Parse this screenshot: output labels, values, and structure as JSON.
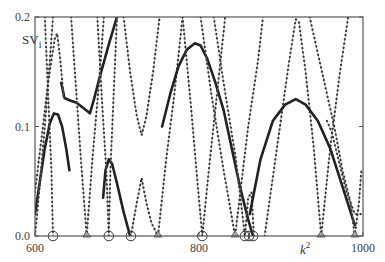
{
  "chart_data": {
    "type": "line",
    "title": "",
    "xlabel": "k^2",
    "ylabel": "SV_i",
    "xlim": [
      600,
      1000
    ],
    "ylim": [
      0.0,
      0.2
    ],
    "xticks": [
      600,
      800,
      1000
    ],
    "xtick_labels": [
      "600",
      "800",
      "1000"
    ],
    "yticks": [
      0.0,
      0.1,
      0.2
    ],
    "ytick_labels": [
      "0.0",
      "0.1",
      "0.2"
    ],
    "grid": false,
    "legend": null,
    "series": [
      {
        "name": "thick-left-hump",
        "style": "solid",
        "points": [
          [
            600,
            0.02
          ],
          [
            606,
            0.05
          ],
          [
            612,
            0.08
          ],
          [
            618,
            0.103
          ],
          [
            623,
            0.112
          ],
          [
            628,
            0.111
          ],
          [
            633,
            0.1
          ],
          [
            638,
            0.08
          ],
          [
            642,
            0.06
          ]
        ]
      },
      {
        "name": "thick-plateau",
        "style": "solid",
        "points": [
          [
            632,
            0.14
          ],
          [
            636,
            0.126
          ],
          [
            642,
            0.124
          ],
          [
            650,
            0.122
          ],
          [
            657,
            0.118
          ],
          [
            664,
            0.114
          ],
          [
            667,
            0.112
          ],
          [
            672,
            0.125
          ],
          [
            680,
            0.148
          ],
          [
            690,
            0.175
          ],
          [
            700,
            0.2
          ]
        ]
      },
      {
        "name": "left-rise-peak",
        "style": "dotted",
        "points": [
          [
            600,
            0.04
          ],
          [
            608,
            0.09
          ],
          [
            616,
            0.14
          ],
          [
            624,
            0.18
          ],
          [
            627,
            0.185
          ],
          [
            631,
            0.16
          ],
          [
            635,
            0.126
          ]
        ]
      },
      {
        "name": "left-steep-1",
        "style": "dotted",
        "points": [
          [
            612,
            0.2
          ],
          [
            616,
            0.13
          ],
          [
            620,
            0.06
          ],
          [
            622,
            0.0
          ]
        ]
      },
      {
        "name": "left-steep-2",
        "style": "dotted",
        "points": [
          [
            600,
            0.0
          ],
          [
            605,
            0.04
          ],
          [
            612,
            0.1
          ],
          [
            618,
            0.16
          ],
          [
            622,
            0.2
          ]
        ]
      },
      {
        "name": "v-663",
        "style": "dotted",
        "points": [
          [
            644,
            0.2
          ],
          [
            650,
            0.135
          ],
          [
            656,
            0.07
          ],
          [
            663,
            0.0
          ],
          [
            670,
            0.07
          ],
          [
            678,
            0.14
          ],
          [
            684,
            0.2
          ]
        ]
      },
      {
        "name": "thick-small-hump",
        "style": "solid",
        "points": [
          [
            683,
            0.035
          ],
          [
            686,
            0.06
          ],
          [
            690,
            0.07
          ],
          [
            694,
            0.066
          ],
          [
            700,
            0.048
          ],
          [
            708,
            0.022
          ],
          [
            716,
            0.0
          ]
        ]
      },
      {
        "name": "steep-690",
        "style": "dotted",
        "points": [
          [
            676,
            0.2
          ],
          [
            682,
            0.12
          ],
          [
            687,
            0.06
          ],
          [
            690,
            0.0
          ],
          [
            692,
            0.06
          ],
          [
            696,
            0.13
          ],
          [
            700,
            0.2
          ]
        ]
      },
      {
        "name": "v-730",
        "style": "dotted",
        "points": [
          [
            708,
            0.2
          ],
          [
            716,
            0.15
          ],
          [
            724,
            0.11
          ],
          [
            730,
            0.092
          ],
          [
            736,
            0.11
          ],
          [
            744,
            0.15
          ],
          [
            752,
            0.2
          ]
        ]
      },
      {
        "name": "hump-734",
        "style": "dotted",
        "points": [
          [
            717,
            0.0
          ],
          [
            724,
            0.03
          ],
          [
            730,
            0.053
          ],
          [
            736,
            0.03
          ],
          [
            742,
            0.012
          ],
          [
            750,
            0.0
          ],
          [
            760,
            0.07
          ],
          [
            770,
            0.13
          ],
          [
            780,
            0.2
          ]
        ]
      },
      {
        "name": "thick-big-dome",
        "style": "solid",
        "points": [
          [
            755,
            0.1
          ],
          [
            765,
            0.13
          ],
          [
            775,
            0.155
          ],
          [
            785,
            0.17
          ],
          [
            795,
            0.176
          ],
          [
            802,
            0.174
          ],
          [
            810,
            0.162
          ],
          [
            820,
            0.14
          ],
          [
            830,
            0.115
          ],
          [
            840,
            0.08
          ],
          [
            850,
            0.045
          ],
          [
            860,
            0.015
          ],
          [
            866,
            0.0
          ]
        ]
      },
      {
        "name": "steep-804",
        "style": "dotted",
        "points": [
          [
            780,
            0.2
          ],
          [
            790,
            0.12
          ],
          [
            798,
            0.05
          ],
          [
            804,
            0.0
          ],
          [
            812,
            0.06
          ],
          [
            822,
            0.13
          ],
          [
            832,
            0.2
          ]
        ]
      },
      {
        "name": "v-844",
        "style": "dotted",
        "points": [
          [
            802,
            0.2
          ],
          [
            815,
            0.13
          ],
          [
            830,
            0.06
          ],
          [
            844,
            0.0
          ],
          [
            852,
            0.05
          ],
          [
            860,
            0.1
          ],
          [
            872,
            0.16
          ],
          [
            878,
            0.2
          ]
        ]
      },
      {
        "name": "cluster-860",
        "style": "dotted",
        "points": [
          [
            818,
            0.2
          ],
          [
            830,
            0.14
          ],
          [
            845,
            0.07
          ],
          [
            856,
            0.0
          ],
          [
            860,
            0.035
          ],
          [
            864,
            0.04
          ],
          [
            867,
            0.0
          ]
        ]
      },
      {
        "name": "peak-920",
        "style": "dotted",
        "points": [
          [
            880,
            0.0
          ],
          [
            895,
            0.08
          ],
          [
            910,
            0.16
          ],
          [
            918,
            0.198
          ],
          [
            922,
            0.195
          ],
          [
            930,
            0.15
          ],
          [
            940,
            0.08
          ],
          [
            949,
            0.0
          ],
          [
            960,
            0.08
          ],
          [
            972,
            0.15
          ],
          [
            982,
            0.2
          ]
        ]
      },
      {
        "name": "thick-right-dome",
        "style": "solid",
        "points": [
          [
            862,
            0.02
          ],
          [
            875,
            0.07
          ],
          [
            890,
            0.105
          ],
          [
            905,
            0.12
          ],
          [
            918,
            0.125
          ],
          [
            930,
            0.12
          ],
          [
            945,
            0.105
          ],
          [
            960,
            0.08
          ],
          [
            975,
            0.045
          ],
          [
            990,
            0.01
          ]
        ]
      },
      {
        "name": "right-steep",
        "style": "dotted",
        "points": [
          [
            935,
            0.2
          ],
          [
            950,
            0.15
          ],
          [
            965,
            0.1
          ],
          [
            975,
            0.06
          ],
          [
            985,
            0.03
          ],
          [
            990,
            0.0
          ],
          [
            995,
            0.03
          ],
          [
            998,
            0.06
          ]
        ]
      },
      {
        "name": "right-steep-2",
        "style": "dotted",
        "points": [
          [
            956,
            0.105
          ],
          [
            962,
            0.095
          ],
          [
            970,
            0.07
          ],
          [
            980,
            0.04
          ],
          [
            990,
            0.02
          ],
          [
            998,
            0.02
          ]
        ]
      }
    ],
    "markers": [
      {
        "k2": 622,
        "shape": "circle"
      },
      {
        "k2": 663,
        "shape": "triangle"
      },
      {
        "k2": 690,
        "shape": "circle"
      },
      {
        "k2": 717,
        "shape": "circle"
      },
      {
        "k2": 750,
        "shape": "triangle"
      },
      {
        "k2": 804,
        "shape": "circle"
      },
      {
        "k2": 844,
        "shape": "triangle"
      },
      {
        "k2": 856,
        "shape": "circle"
      },
      {
        "k2": 861,
        "shape": "circle"
      },
      {
        "k2": 866,
        "shape": "circle"
      },
      {
        "k2": 949,
        "shape": "triangle"
      },
      {
        "k2": 990,
        "shape": "triangle"
      }
    ]
  },
  "axes": {
    "ylabel_main": "SV",
    "ylabel_sub": "i",
    "xlabel_main": "k",
    "xlabel_sup": "2"
  }
}
